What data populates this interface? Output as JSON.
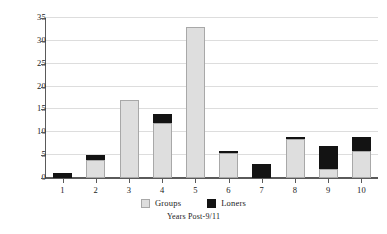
{
  "chart_data": {
    "type": "bar",
    "stacked": true,
    "title": "",
    "subtitle": "",
    "xlabel": "Years Post-9/11",
    "ylabel": "",
    "categories": [
      "1",
      "2",
      "3",
      "4",
      "5",
      "6",
      "7",
      "8",
      "9",
      "10"
    ],
    "series": [
      {
        "name": "Groups",
        "color": "#dedede",
        "values": [
          0,
          4,
          17,
          12,
          33,
          5.5,
          0,
          8.5,
          2,
          6
        ]
      },
      {
        "name": "Loners",
        "color": "#131313",
        "values": [
          1,
          1,
          0,
          2,
          0,
          0.5,
          3,
          0.5,
          5,
          3
        ]
      }
    ],
    "totals": [
      1,
      5,
      17,
      14,
      33,
      6,
      3,
      9,
      7,
      9
    ],
    "ylim": [
      0,
      35
    ],
    "yticks": [
      "0",
      "5",
      "10",
      "15",
      "20",
      "25",
      "30",
      "35"
    ],
    "ytick_values": [
      0,
      5,
      10,
      15,
      20,
      25,
      30,
      35
    ],
    "grid": true,
    "grid_axis": "y",
    "legend_position": "bottom-center",
    "legend_entries": [
      "Groups",
      "Loners"
    ],
    "background_color": "#ffffff",
    "axis_color": "#5a5a5a",
    "gridline_color": "#dddddd"
  }
}
